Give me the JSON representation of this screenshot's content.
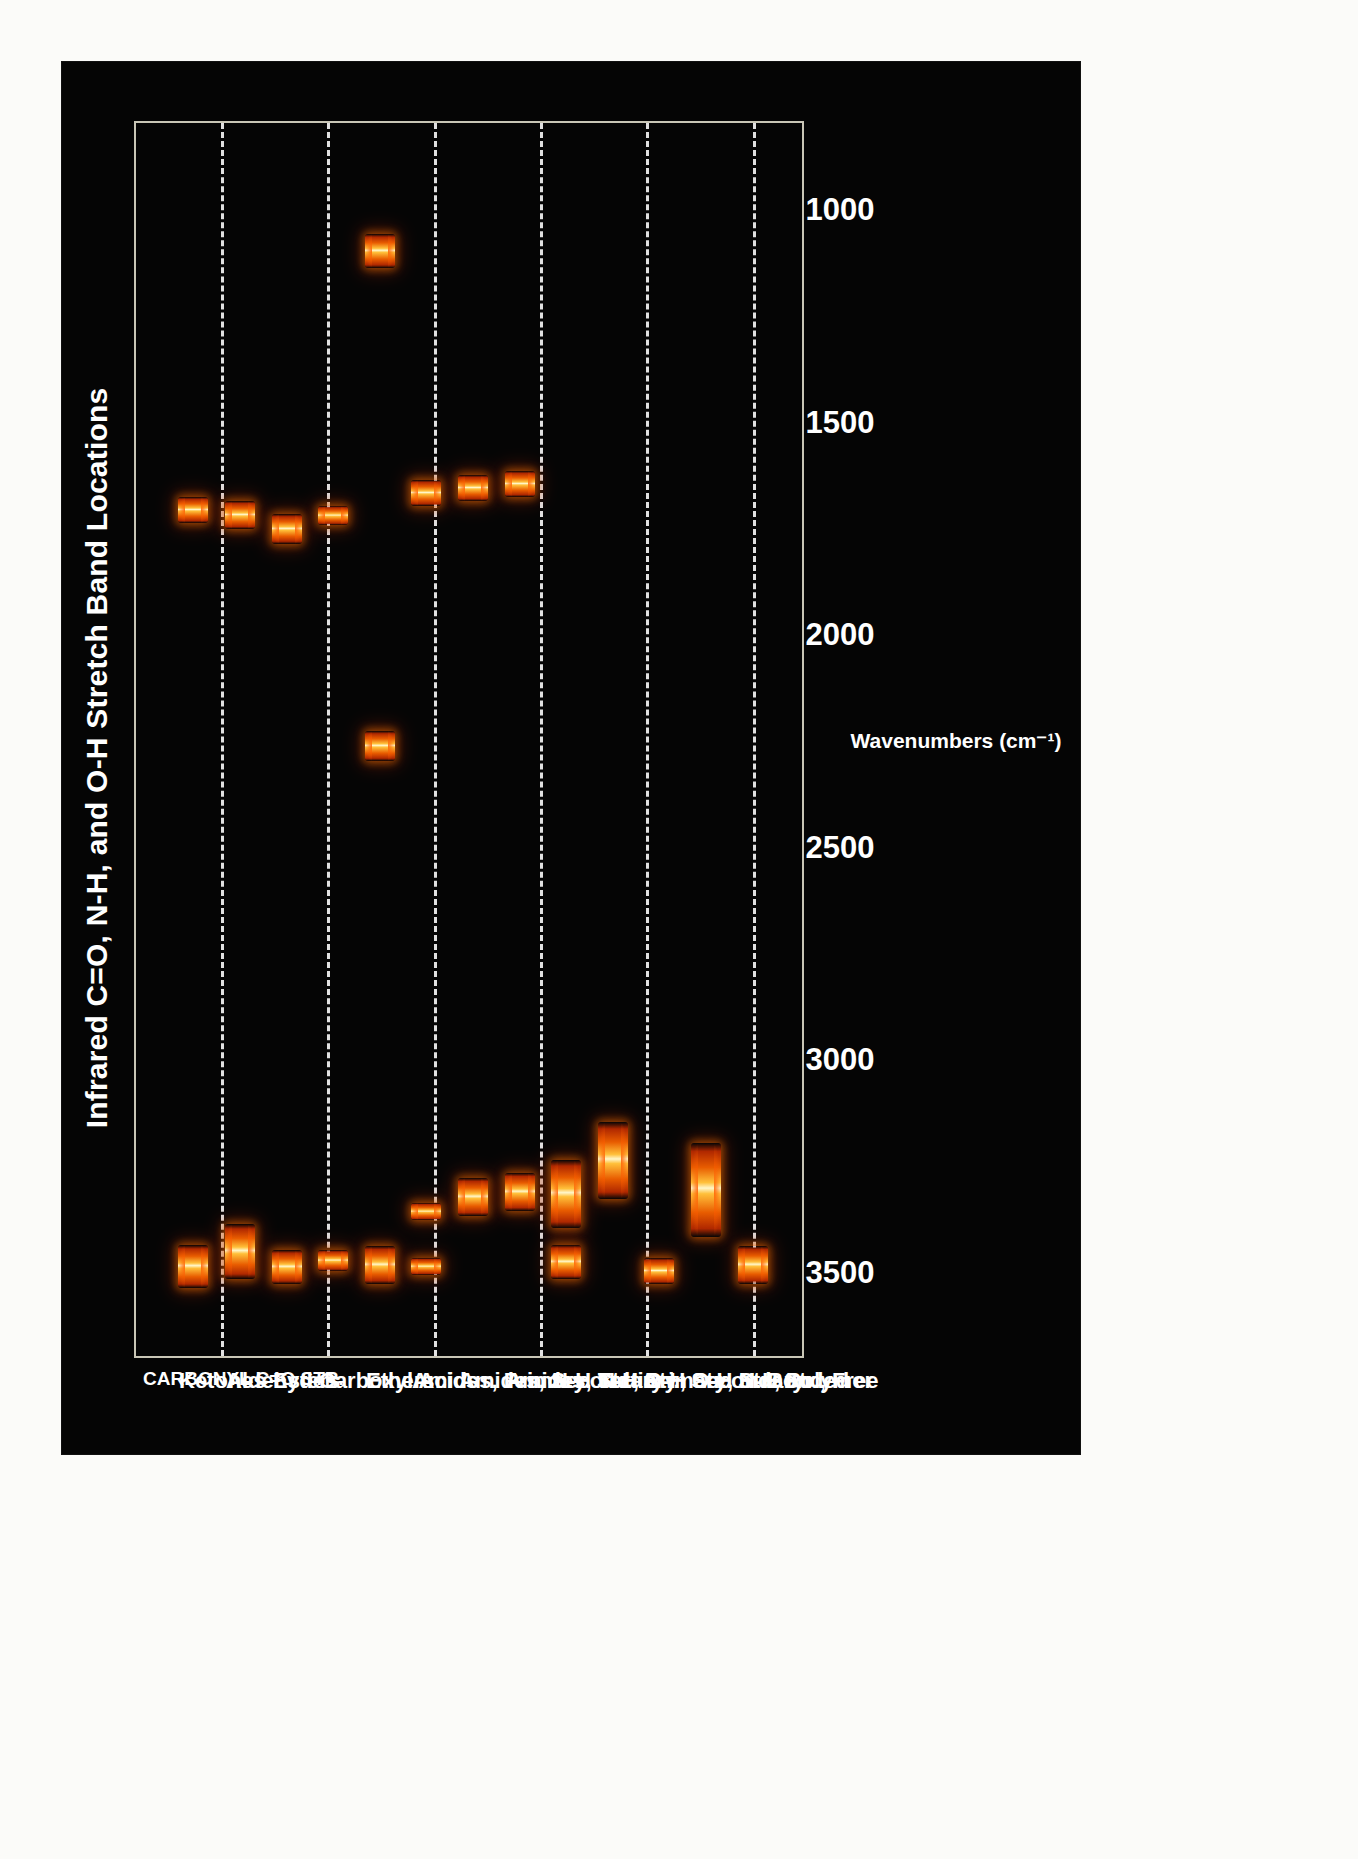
{
  "poster": {
    "background_color": "#050505",
    "page_background_color": "#fbfbf9"
  },
  "chart_data": {
    "type": "bar",
    "orientation": "horizontal-ranges",
    "title": "Infrared C=O, N-H, and O-H Stretch Band Locations",
    "xlabel": "Wavenumbers (cm⁻¹)",
    "ylabel": "",
    "xlim": [
      3700,
      800
    ],
    "x_axis_reversed": true,
    "grid": true,
    "grid_style": "dashed",
    "grid_color": "#ededed",
    "legend": "none",
    "band_color_core": "#fff6c9",
    "band_color_mid": "#ffc03a",
    "band_color_edge": "#b02800",
    "xticks": [
      3500,
      3000,
      2500,
      2000,
      1500,
      1000
    ],
    "xticklabels": [
      "3500",
      "3000",
      "2500",
      "2000",
      "1500",
      "1000"
    ],
    "gridline_values": [
      3500,
      3250,
      3000,
      2750,
      2500,
      2250,
      2000,
      1750,
      1500,
      1250,
      1000
    ],
    "section_header": "CARBONYL C=O STR.",
    "categories": [
      "Ketones",
      "Aldehydes",
      "Esters",
      "Carboxyl Acids",
      "Ethers",
      "Amides, Primary",
      "Amides, Secondary",
      "Amides, Tertiary",
      "N-H Str., Primary",
      "N-H Str., Secondary",
      "O-H Str., H. Bonded",
      "O-H Str., Polymer",
      "N-H Str., Free"
    ],
    "series": [
      {
        "category": "Ketones",
        "bands": [
          [
            1740,
            1680
          ],
          [
            3540,
            3440
          ]
        ]
      },
      {
        "category": "Aldehydes",
        "bands": [
          [
            1755,
            1690
          ],
          [
            3520,
            3390
          ]
        ]
      },
      {
        "category": "Esters",
        "bands": [
          [
            1790,
            1720
          ],
          [
            3530,
            3450
          ]
        ]
      },
      {
        "category": "Carboxyl Acids",
        "bands": [
          [
            1745,
            1700
          ],
          [
            3500,
            3450
          ]
        ]
      },
      {
        "category": "Ethers",
        "bands": [
          [
            1140,
            1060
          ],
          [
            2300,
            2230
          ],
          [
            3530,
            3440
          ]
        ]
      },
      {
        "category": "Amides, Primary",
        "bands": [
          [
            1700,
            1640
          ],
          [
            3380,
            3340
          ],
          [
            3510,
            3470
          ]
        ]
      },
      {
        "category": "Amides, Secondary",
        "bands": [
          [
            1690,
            1630
          ],
          [
            3370,
            3280
          ]
        ]
      },
      {
        "category": "Amides, Tertiary",
        "bands": [
          [
            1680,
            1620
          ],
          [
            3360,
            3270
          ]
        ]
      },
      {
        "category": "N-H Str., Primary",
        "bands": [
          [
            3400,
            3240
          ],
          [
            3520,
            3440
          ]
        ]
      },
      {
        "category": "N-H Str., Secondary",
        "bands": [
          [
            3330,
            3150
          ]
        ]
      },
      {
        "category": "O-H Str., H. Bonded",
        "bands": [
          [
            3530,
            3470
          ]
        ]
      },
      {
        "category": "O-H Str., Polymer",
        "bands": [
          [
            3420,
            3200
          ]
        ]
      },
      {
        "category": "N-H Str., Free",
        "bands": [
          [
            3530,
            3440
          ]
        ]
      }
    ]
  }
}
